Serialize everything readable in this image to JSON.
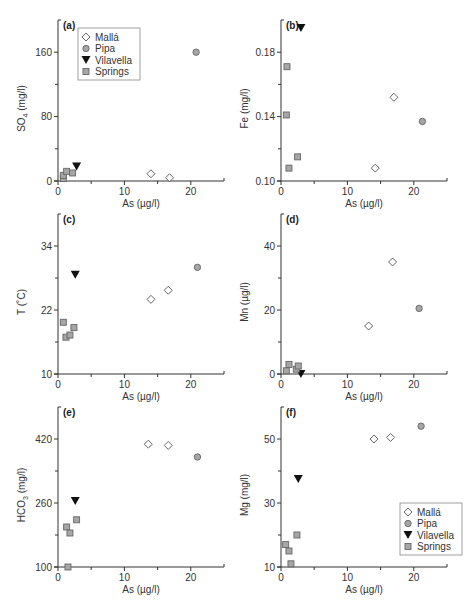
{
  "chart_data": [
    {
      "type": "scatter",
      "panel": "(a)",
      "xlabel": "As (µg/l)",
      "ylabel": "SO4 (mg/l)",
      "ylabel_main": "SO",
      "ylabel_sub": "4",
      "ylabel_unit": " (mg/l)",
      "xlim": [
        0,
        25
      ],
      "ylim": [
        0,
        200
      ],
      "xticks": [
        0,
        10,
        20
      ],
      "yticks": [
        0,
        80,
        160
      ],
      "ytick_labels": [
        "0",
        "80",
        "160"
      ],
      "yminor": [
        40,
        120
      ],
      "legend": true,
      "legend_position": "upper-left",
      "series": [
        {
          "name": "Mallá",
          "marker": "diamond-open",
          "points": [
            [
              14,
              9
            ],
            [
              16.8,
              4
            ]
          ]
        },
        {
          "name": "Pipa",
          "marker": "circle-gray",
          "points": [
            [
              20.8,
              160
            ]
          ]
        },
        {
          "name": "Vilavella",
          "marker": "triangle-down",
          "points": [
            [
              2.8,
              18
            ]
          ]
        },
        {
          "name": "Springs",
          "marker": "square-gray",
          "points": [
            [
              0.8,
              3
            ],
            [
              0.8,
              7
            ],
            [
              1.3,
              12
            ],
            [
              2.2,
              10
            ]
          ]
        }
      ]
    },
    {
      "type": "scatter",
      "panel": "(b)",
      "xlabel": "As (µg/l)",
      "ylabel": "Fe (mg/l)",
      "ylabel_main": "Fe (mg/l)",
      "ylabel_sub": "",
      "ylabel_unit": "",
      "xlim": [
        0,
        25
      ],
      "ylim": [
        0.1,
        0.2
      ],
      "xticks": [
        0,
        10,
        20
      ],
      "yticks": [
        0.1,
        0.14,
        0.18
      ],
      "ytick_labels": [
        "0.10",
        "0.14",
        "0.18"
      ],
      "yminor": [
        0.12,
        0.16
      ],
      "legend": false,
      "series": [
        {
          "name": "Mallá",
          "marker": "diamond-open",
          "points": [
            [
              14.2,
              0.108
            ],
            [
              17,
              0.152
            ]
          ]
        },
        {
          "name": "Pipa",
          "marker": "circle-gray",
          "points": [
            [
              21.3,
              0.137
            ]
          ]
        },
        {
          "name": "Vilavella",
          "marker": "triangle-down",
          "points": [
            [
              3,
              0.195
            ]
          ]
        },
        {
          "name": "Springs",
          "marker": "square-gray",
          "points": [
            [
              0.9,
              0.171
            ],
            [
              0.8,
              0.141
            ],
            [
              1.2,
              0.108
            ],
            [
              2.5,
              0.115
            ]
          ]
        }
      ]
    },
    {
      "type": "scatter",
      "panel": "(c)",
      "xlabel": "As (µg/l)",
      "ylabel": "T (˚C)",
      "ylabel_main": "T (˚C)",
      "ylabel_sub": "",
      "ylabel_unit": "",
      "xlim": [
        0,
        25
      ],
      "ylim": [
        10,
        40
      ],
      "xticks": [
        0,
        10,
        20
      ],
      "yticks": [
        10,
        22,
        34
      ],
      "ytick_labels": [
        "10",
        "22",
        "34"
      ],
      "yminor": [
        16,
        28
      ],
      "legend": false,
      "series": [
        {
          "name": "Mallá",
          "marker": "diamond-open",
          "points": [
            [
              14,
              24
            ],
            [
              16.6,
              25.7
            ]
          ]
        },
        {
          "name": "Pipa",
          "marker": "circle-gray",
          "points": [
            [
              21,
              30
            ]
          ]
        },
        {
          "name": "Vilavella",
          "marker": "triangle-down",
          "points": [
            [
              2.6,
              28.6
            ]
          ]
        },
        {
          "name": "Springs",
          "marker": "square-gray",
          "points": [
            [
              0.8,
              19.7
            ],
            [
              1.2,
              16.9
            ],
            [
              1.8,
              17.3
            ],
            [
              2.4,
              18.7
            ]
          ]
        }
      ]
    },
    {
      "type": "scatter",
      "panel": "(d)",
      "xlabel": "As (µg/l)",
      "ylabel": "Mn (µg/l)",
      "ylabel_main": "Mn (µg/l)",
      "ylabel_sub": "",
      "ylabel_unit": "",
      "xlim": [
        0,
        25
      ],
      "ylim": [
        0,
        50
      ],
      "xticks": [
        0,
        10,
        20
      ],
      "yticks": [
        0,
        20,
        40
      ],
      "ytick_labels": [
        "0",
        "20",
        "40"
      ],
      "yminor": [
        10,
        30
      ],
      "legend": false,
      "series": [
        {
          "name": "Mallá",
          "marker": "diamond-open",
          "points": [
            [
              13.2,
              15
            ],
            [
              16.8,
              35
            ]
          ]
        },
        {
          "name": "Pipa",
          "marker": "circle-gray",
          "points": [
            [
              20.8,
              20.5
            ]
          ]
        },
        {
          "name": "Vilavella",
          "marker": "triangle-down",
          "points": [
            [
              3,
              0
            ]
          ]
        },
        {
          "name": "Springs",
          "marker": "square-gray",
          "points": [
            [
              0.8,
              1
            ],
            [
              1.2,
              3
            ],
            [
              2.3,
              1.5
            ],
            [
              2.6,
              2.5
            ]
          ]
        }
      ]
    },
    {
      "type": "scatter",
      "panel": "(e)",
      "xlabel": "As (µg/l)",
      "ylabel": "HCO3 (mg/l)",
      "ylabel_main": "HCO",
      "ylabel_sub": "3",
      "ylabel_unit": " (mg/l)",
      "xlim": [
        0,
        25
      ],
      "ylim": [
        100,
        500
      ],
      "xticks": [
        0,
        10,
        20
      ],
      "yticks": [
        100,
        260,
        420
      ],
      "ytick_labels": [
        "100",
        "260",
        "420"
      ],
      "yminor": [
        180,
        340
      ],
      "legend": false,
      "series": [
        {
          "name": "Mallá",
          "marker": "diamond-open",
          "points": [
            [
              13.6,
              407
            ],
            [
              16.6,
              404
            ]
          ]
        },
        {
          "name": "Pipa",
          "marker": "circle-gray",
          "points": [
            [
              21,
              375
            ]
          ]
        },
        {
          "name": "Vilavella",
          "marker": "triangle-down",
          "points": [
            [
              2.6,
              265
            ]
          ]
        },
        {
          "name": "Springs",
          "marker": "square-gray",
          "points": [
            [
              1.3,
              200
            ],
            [
              1.8,
              185
            ],
            [
              2.8,
              218
            ],
            [
              1.5,
              100
            ]
          ]
        }
      ]
    },
    {
      "type": "scatter",
      "panel": "(f)",
      "xlabel": "As (µg/l)",
      "ylabel": "Mg (mg/l)",
      "ylabel_main": "Mg (mg/l)",
      "ylabel_sub": "",
      "ylabel_unit": "",
      "xlim": [
        0,
        25
      ],
      "ylim": [
        10,
        60
      ],
      "xticks": [
        0,
        10,
        20
      ],
      "yticks": [
        10,
        30,
        50
      ],
      "ytick_labels": [
        "10",
        "30",
        "50"
      ],
      "yminor": [
        20,
        40
      ],
      "legend": true,
      "legend_position": "lower-right",
      "series": [
        {
          "name": "Mallá",
          "marker": "diamond-open",
          "points": [
            [
              14,
              50
            ],
            [
              16.5,
              50.5
            ]
          ]
        },
        {
          "name": "Pipa",
          "marker": "circle-gray",
          "points": [
            [
              21.1,
              54
            ]
          ]
        },
        {
          "name": "Vilavella",
          "marker": "triangle-down",
          "points": [
            [
              2.6,
              37.5
            ]
          ]
        },
        {
          "name": "Springs",
          "marker": "square-gray",
          "points": [
            [
              0.7,
              17
            ],
            [
              1.2,
              15
            ],
            [
              1.5,
              11
            ],
            [
              2.4,
              20
            ]
          ]
        }
      ]
    }
  ],
  "layout": {
    "panels": [
      {
        "x0": 58,
        "x1": 224,
        "yTop": 20,
        "yBot": 181,
        "legend": [
          78,
          28
        ]
      },
      {
        "x0": 281,
        "x1": 447,
        "yTop": 20,
        "yBot": 181,
        "legend": null
      },
      {
        "x0": 58,
        "x1": 224,
        "yTop": 214,
        "yBot": 374,
        "legend": null
      },
      {
        "x0": 281,
        "x1": 447,
        "yTop": 214,
        "yBot": 374,
        "legend": null
      },
      {
        "x0": 58,
        "x1": 224,
        "yTop": 407,
        "yBot": 567,
        "legend": null
      },
      {
        "x0": 281,
        "x1": 447,
        "yTop": 407,
        "yBot": 567,
        "legend": [
          400,
          503
        ]
      }
    ],
    "colors": {
      "axis": "#333333",
      "gray_fill": "#a6a6a6",
      "gray_stroke": "#666666",
      "black": "#111111"
    }
  }
}
